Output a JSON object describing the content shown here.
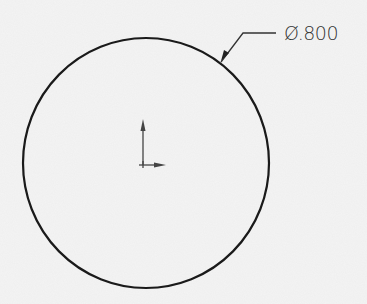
{
  "drawing": {
    "shape": "circle",
    "center": [
      146,
      163
    ],
    "radius": 123,
    "stroke_color": "#1a1a1a",
    "background_color": "#f4f4f4"
  },
  "dimension": {
    "label": "Ø.800",
    "symbol": "diameter",
    "value": ".800"
  },
  "origin_marker": {
    "icon": "coordinate-axes-icon",
    "position": [
      143,
      163
    ]
  }
}
